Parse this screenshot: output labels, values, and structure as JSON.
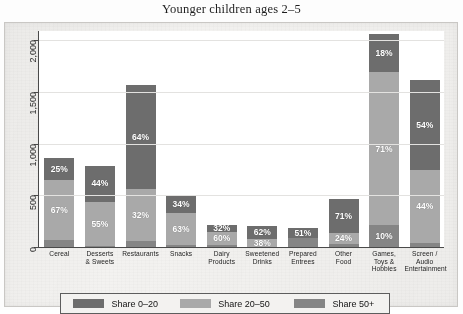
{
  "chart_data": {
    "type": "bar",
    "title": "Younger children ages 2–5",
    "xlabel": "",
    "ylabel": "",
    "ylim": [
      0,
      2100
    ],
    "grid": true,
    "legend_position": "bottom",
    "stacked": true,
    "ytick_labels": [
      "0",
      "500",
      "1,000",
      "1,500",
      "2,000"
    ],
    "ytick_values": [
      0,
      500,
      1000,
      1500,
      2000
    ],
    "categories": [
      "Cereal",
      "Desserts & Sweets",
      "Restaurants",
      "Snacks",
      "Dairy Products",
      "Sweetened Drinks",
      "Prepared Entrees",
      "Other Food",
      "Games, Toys & Hobbies",
      "Screen / Audio Entertainment"
    ],
    "category_lines": [
      [
        "Cereal"
      ],
      [
        "Desserts",
        "& Sweets"
      ],
      [
        "Restaurants"
      ],
      [
        "Snacks"
      ],
      [
        "Dairy",
        "Products"
      ],
      [
        "Sweetened",
        "Drinks"
      ],
      [
        "Prepared",
        "Entrees"
      ],
      [
        "Other",
        "Food"
      ],
      [
        "Games,",
        "Toys &",
        "Hobbies"
      ],
      [
        "Screen /",
        "Audio",
        "Entertainment"
      ]
    ],
    "series": [
      {
        "name": "Share 0–20",
        "color": "#6d6d6d",
        "values": [
          215,
          345,
          1005,
          170,
          70,
          125,
          95,
          330,
          375,
          870
        ],
        "labels": [
          "25%",
          "44%",
          "64%",
          "34%",
          "32%",
          "62%",
          "51%",
          "71%",
          "18%",
          "54%"
        ]
      },
      {
        "name": "Share 20–50",
        "color": "#a9a9a9",
        "values": [
          575,
          430,
          500,
          315,
          130,
          76,
          0,
          110,
          1480,
          710
        ],
        "labels": [
          "67%",
          "55%",
          "32%",
          "63%",
          "60%",
          "38%",
          "",
          "24%",
          "71%",
          "44%"
        ]
      },
      {
        "name": "Share 50+",
        "color": "#858585",
        "values": [
          70,
          10,
          60,
          15,
          18,
          0,
          90,
          25,
          210,
          35
        ],
        "labels": [
          "",
          "",
          "",
          "",
          "",
          "",
          "",
          "",
          "10%",
          ""
        ]
      }
    ],
    "totals": [
      860,
      785,
      1565,
      500,
      218,
      201,
      185,
      465,
      2065,
      1615
    ],
    "legend": [
      {
        "label": "Share 0–20",
        "color": "#6d6d6d"
      },
      {
        "label": "Share 20–50",
        "color": "#a9a9a9"
      },
      {
        "label": "Share 50+",
        "color": "#858585"
      }
    ]
  }
}
